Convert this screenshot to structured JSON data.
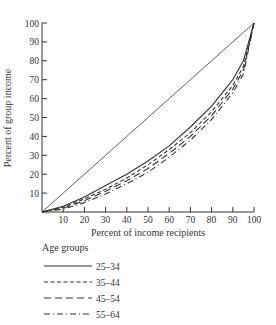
{
  "chart_data": {
    "type": "line",
    "title": "",
    "xlabel": "Percent of income recipients",
    "ylabel": "Percent of group income",
    "xlim": [
      0,
      100
    ],
    "ylim": [
      0,
      100
    ],
    "x_ticks": [
      10,
      20,
      30,
      40,
      50,
      60,
      70,
      80,
      90,
      100
    ],
    "y_ticks": [
      10,
      20,
      30,
      40,
      50,
      60,
      70,
      80,
      90,
      100
    ],
    "grid": false,
    "legend_title": "Age groups",
    "legend_position": "below",
    "x": [
      0,
      10,
      20,
      30,
      40,
      50,
      60,
      70,
      80,
      90,
      95,
      100
    ],
    "series": [
      {
        "name": "Line of equality",
        "style": "solid-thin",
        "values": [
          0,
          10,
          20,
          30,
          40,
          50,
          60,
          70,
          80,
          90,
          95,
          100
        ]
      },
      {
        "name": "25-34",
        "style": "solid",
        "values": [
          0,
          3,
          8,
          14,
          20,
          27,
          35,
          45,
          56,
          70,
          80,
          100
        ]
      },
      {
        "name": "35-44",
        "style": "short-dash",
        "values": [
          0,
          2.5,
          7,
          12,
          18,
          25,
          33,
          42,
          53,
          67,
          77,
          100
        ]
      },
      {
        "name": "45-54",
        "style": "long-dash",
        "values": [
          0,
          2,
          6,
          11,
          16.5,
          23,
          31,
          40,
          51,
          65,
          75,
          100
        ]
      },
      {
        "name": "55-64",
        "style": "dash-dot",
        "values": [
          0,
          1.5,
          5,
          9.5,
          15,
          21,
          29,
          38,
          49,
          63,
          73,
          100
        ]
      }
    ]
  },
  "axes": {
    "x_title": "Percent of income recipients",
    "y_title": "Percent of group income"
  },
  "legend": {
    "title": "Age groups",
    "items": [
      {
        "label": "25–34",
        "style": "solid"
      },
      {
        "label": "35–44",
        "style": "short-dash"
      },
      {
        "label": "45–54",
        "style": "long-dash"
      },
      {
        "label": "55–64",
        "style": "dash-dot"
      }
    ]
  }
}
